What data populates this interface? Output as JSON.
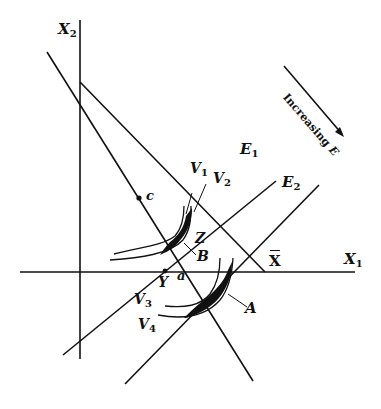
{
  "diagram": {
    "axes": {
      "x1_label": "X",
      "x1_sub": "1",
      "x2_label": "X",
      "x2_sub": "2"
    },
    "lines": {
      "E1_label": "E",
      "E1_sub": "1",
      "E2_label": "E",
      "E2_sub": "2",
      "xbar_label": "X"
    },
    "curves": {
      "V1_label": "V",
      "V1_sub": "1",
      "V2_label": "V",
      "V2_sub": "2",
      "V3_label": "V",
      "V3_sub": "3",
      "V4_label": "V",
      "V4_sub": "4"
    },
    "points": {
      "c": "c",
      "Z": "Z",
      "B": "B",
      "Y": "Y",
      "a": "a",
      "A": "A"
    },
    "annotation": {
      "increasing_text": "Increasing",
      "increasing_var": "E"
    },
    "colors": {
      "ink": "#111111",
      "background": "#ffffff"
    }
  }
}
